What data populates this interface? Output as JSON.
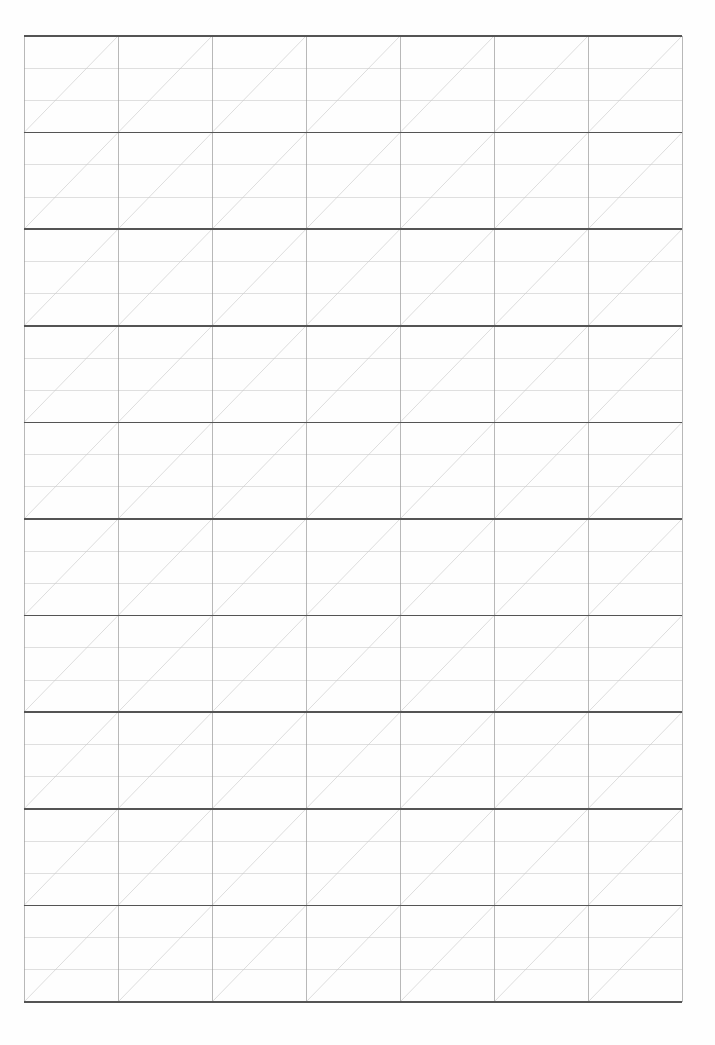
{
  "page": {
    "document_type": "blank-ruled-practice-paper",
    "width": 715,
    "height": 1045,
    "background_color": "#fefefe",
    "paper_color": "#ffffff"
  },
  "grid": {
    "label": "practice-grid",
    "description": "Blank calligraphy / handwriting practice grid with slant guide diagonals",
    "origin_x": 24,
    "origin_y": 36,
    "columns": 7,
    "rows": 10,
    "cell_width": 94,
    "cell_height": 96.6,
    "total_width": 658,
    "total_height": 966,
    "subdivisions_per_cell": 3,
    "diagonal_direction": "bottom-left-to-top-right",
    "colors": {
      "row_rule": "#545454",
      "column_rule": "#9a9a9a",
      "guide_rule": "#c9c9c9",
      "diagonal_rule": "#cfcfcf"
    },
    "stroke_widths": {
      "row_rule": 1.6,
      "column_rule": 0.7,
      "guide_rule": 0.6,
      "diagonal_rule": 0.7
    }
  },
  "chart_data": {
    "type": "table",
    "xlabel": "",
    "ylabel": "",
    "categories": [
      "col-1",
      "col-2",
      "col-3",
      "col-4",
      "col-5",
      "col-6",
      "col-7"
    ],
    "values": [
      0,
      0,
      0,
      0,
      0,
      0,
      0
    ],
    "grid": true,
    "legend": "none"
  }
}
